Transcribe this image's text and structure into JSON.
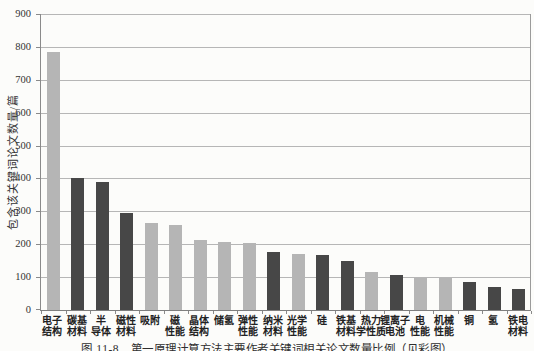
{
  "figure": {
    "caption": "图 11-8　第一原理计算方法主要作者关键词相关论文数量比例（见彩图）"
  },
  "chart_data": {
    "type": "bar",
    "title": "",
    "xlabel": "",
    "ylabel": "包含该关键词论文数量/篇",
    "ylim": [
      0,
      900
    ],
    "ytick_step": 100,
    "grid": true,
    "legend": "none",
    "categories": [
      "电子结构",
      "碳基材料",
      "半导体",
      "磁性材料",
      "吸附",
      "磁性能",
      "晶体结构",
      "储氢",
      "弹性性能",
      "纳米材料",
      "光学性能",
      "硅",
      "铁基材料",
      "热力学性质",
      "锂离子电池",
      "电性能",
      "机械性能",
      "铜",
      "氢",
      "铁电材料"
    ],
    "category_lines": [
      [
        "电子",
        "结构"
      ],
      [
        "碳基",
        "材料"
      ],
      [
        "半",
        "导体"
      ],
      [
        "磁性",
        "材料"
      ],
      [
        "吸附",
        ""
      ],
      [
        "磁",
        "性能"
      ],
      [
        "晶体",
        "结构"
      ],
      [
        "储氢",
        ""
      ],
      [
        "弹性",
        "性能"
      ],
      [
        "纳米",
        "材料"
      ],
      [
        "光学",
        "性能"
      ],
      [
        "硅",
        ""
      ],
      [
        "铁基",
        "材料"
      ],
      [
        "热力",
        "学性质"
      ],
      [
        "锂离子",
        "电池"
      ],
      [
        "电",
        "性能"
      ],
      [
        "机械",
        "性能"
      ],
      [
        "铜",
        ""
      ],
      [
        "氢",
        ""
      ],
      [
        "铁电",
        "材料"
      ]
    ],
    "values": [
      785,
      400,
      390,
      295,
      265,
      258,
      213,
      208,
      205,
      175,
      170,
      166,
      150,
      115,
      105,
      98,
      96,
      85,
      70,
      65
    ],
    "bar_tone": [
      "light",
      "dark",
      "dark",
      "dark",
      "light",
      "light",
      "light",
      "light",
      "light",
      "dark",
      "light",
      "dark",
      "dark",
      "light",
      "dark",
      "light",
      "light",
      "dark",
      "dark",
      "dark"
    ],
    "colors": {
      "light_bar": "#b5b5b5",
      "dark_bar": "#474747",
      "gridline": "#b6b6b6",
      "axis": "#8a8a8a",
      "text": "#3d3d3d",
      "background": "#fcfcfa"
    }
  }
}
